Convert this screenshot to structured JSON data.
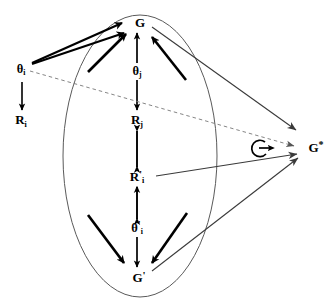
{
  "diagram": {
    "colors": {
      "stroke_dark": "#000000",
      "stroke_thin": "#4a4a4a",
      "ellipse": "#555555",
      "dashed": "#777777",
      "background": "#ffffff"
    },
    "nodes": [
      {
        "id": "g_top",
        "label_html": "G",
        "plain": "G",
        "x": 140,
        "y": 22,
        "size": "n-lg",
        "inside_ellipse": true
      },
      {
        "id": "theta_j",
        "label_html": "θ",
        "plain": "θj",
        "sub": "j",
        "x": 137,
        "y": 72,
        "size": "n-md",
        "inside_ellipse": true
      },
      {
        "id": "r_j",
        "label_html": "R",
        "plain": "Rj",
        "sub": "j",
        "x": 137,
        "y": 121,
        "size": "n-lg",
        "inside_ellipse": true
      },
      {
        "id": "r_prime_i",
        "label_html": "R",
        "plain": "R'i",
        "sub": "i",
        "prime": true,
        "x": 137,
        "y": 177,
        "size": "n-lg",
        "inside_ellipse": true
      },
      {
        "id": "theta_prime_i",
        "label_html": "θ",
        "plain": "θ'i",
        "sub": "i",
        "prime": true,
        "x": 137,
        "y": 228,
        "size": "n-md",
        "inside_ellipse": true
      },
      {
        "id": "g_bottom",
        "label_html": "G",
        "plain": "G'",
        "prime": true,
        "x": 139,
        "y": 277,
        "size": "n-lg",
        "inside_ellipse": true
      },
      {
        "id": "theta_i",
        "label_html": "θ",
        "plain": "θi",
        "sub": "i",
        "x": 21,
        "y": 70,
        "size": "n-md",
        "inside_ellipse": false
      },
      {
        "id": "r_i",
        "label_html": "R",
        "plain": "Ri",
        "sub": "i",
        "x": 21,
        "y": 121,
        "size": "n-lg",
        "inside_ellipse": false
      },
      {
        "id": "g_star",
        "label_html": "G",
        "plain": "G*",
        "star": true,
        "x": 316,
        "y": 147,
        "size": "n-lg",
        "inside_ellipse": false
      },
      {
        "id": "g_loop",
        "label_html": "G",
        "plain": "G",
        "x": 259,
        "y": 148,
        "size": "n-md",
        "inside_ellipse": false
      }
    ],
    "labels": {
      "g_top": "G",
      "theta_j": "θ",
      "theta_j_sub": "j",
      "r_j": "R",
      "r_j_sub": "j",
      "r_prime_i": "R",
      "r_prime_i_sub": "i",
      "theta_prime_i": "θ",
      "theta_prime_i_sub": "i",
      "g_bottom": "G",
      "theta_i": "θ",
      "theta_i_sub": "i",
      "r_i": "R",
      "r_i_sub": "i",
      "g_star": "G",
      "g_loop": "G",
      "prime_mark": "'",
      "star_mark": "*"
    },
    "ellipse": {
      "cx": 140,
      "cy": 156,
      "rx": 77,
      "ry": 141
    },
    "edges": [
      {
        "id": "theta_i-to-r_i",
        "from": "theta_i",
        "to": "r_i",
        "style": "solid-thin-arrow",
        "direction": "down"
      },
      {
        "id": "g_top-to-theta_j",
        "from": "g_top",
        "to": "theta_j",
        "style": "double-arrow",
        "direction": "bidirectional"
      },
      {
        "id": "theta_j-to-r_j",
        "from": "theta_j",
        "to": "r_j",
        "style": "double-arrow",
        "direction": "bidirectional"
      },
      {
        "id": "r_j-to-r_prime_i",
        "from": "r_j",
        "to": "r_prime_i",
        "style": "double-arrow",
        "direction": "bidirectional"
      },
      {
        "id": "r_prime_i-to-theta_prime_i",
        "from": "r_prime_i",
        "to": "theta_prime_i",
        "style": "double-arrow",
        "direction": "bidirectional"
      },
      {
        "id": "theta_prime_i-to-g_bottom",
        "from": "theta_prime_i",
        "to": "g_bottom",
        "style": "double-arrow",
        "direction": "bidirectional"
      },
      {
        "id": "theta_i-to-g_top-long",
        "from": "theta_i",
        "to": "g_top",
        "style": "thick-arrow",
        "direction": "up-right"
      },
      {
        "id": "r_i-region-to-g_top",
        "from": "theta_i",
        "to": "g_top",
        "style": "thick-arrow",
        "direction": "up-right"
      },
      {
        "id": "inner-left-to-g_top",
        "from": "ellipse-left",
        "to": "g_top",
        "style": "thick-arrow",
        "direction": "up-right"
      },
      {
        "id": "inner-right-to-g_top",
        "from": "ellipse-right",
        "to": "g_top",
        "style": "thick-arrow",
        "direction": "up-left"
      },
      {
        "id": "inner-left-to-g_bottom",
        "from": "ellipse-left",
        "to": "g_bottom",
        "style": "thick-arrow",
        "direction": "down-right"
      },
      {
        "id": "inner-right-to-g_bottom",
        "from": "ellipse-right",
        "to": "g_bottom",
        "style": "thick-arrow",
        "direction": "down-left"
      },
      {
        "id": "g_top-to-g_star",
        "from": "g_top",
        "to": "g_star",
        "style": "thin-arrow",
        "direction": "right-down"
      },
      {
        "id": "r_prime_i-to-g_star",
        "from": "r_prime_i",
        "to": "g_star",
        "style": "thin-arrow",
        "direction": "right-up"
      },
      {
        "id": "g_bottom-to-g_star",
        "from": "g_bottom",
        "to": "g_star",
        "style": "thin-arrow",
        "direction": "right-up"
      },
      {
        "id": "theta_i-to-g_star-dashed",
        "from": "theta_i",
        "to": "g_star",
        "style": "dashed-arrow",
        "direction": "right-down"
      },
      {
        "id": "g_loop-self",
        "from": "g_loop",
        "to": "g_loop",
        "style": "self-loop-arrow",
        "direction": "right"
      }
    ]
  }
}
